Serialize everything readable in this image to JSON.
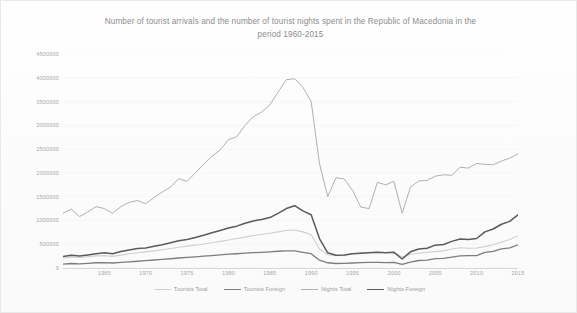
{
  "chart_data": {
    "type": "line",
    "title": "Number of tourist arrivals and the number of tourist nights spent in the Republic of Macedonia in the period 1960-2015",
    "title_line1": "Number of tourist arrivals and the number of tourist nights spent in the Republic of Macedonia in the",
    "title_line2": "period 1960-2015",
    "xlabel": "",
    "ylabel": "",
    "grid": "horizontal-faint",
    "legend_position": "bottom",
    "xlim": [
      1960,
      2015
    ],
    "ylim": [
      0,
      4500000
    ],
    "ytick_labels": [
      "4500000",
      "4000000",
      "3500000",
      "3000000",
      "2500000",
      "2000000",
      "1500000",
      "1000000",
      "500000",
      "0"
    ],
    "ytick_values": [
      4500000,
      4000000,
      3500000,
      3000000,
      2500000,
      2000000,
      1500000,
      1000000,
      500000,
      0
    ],
    "xtick_labels": [
      "1965",
      "1970",
      "1975",
      "1980",
      "1985",
      "1990",
      "1995",
      "2000",
      "2005",
      "2010",
      "2015"
    ],
    "xtick_values": [
      1965,
      1970,
      1975,
      1980,
      1985,
      1990,
      1995,
      2000,
      2005,
      2010,
      2015
    ],
    "x": [
      1960,
      1961,
      1962,
      1963,
      1964,
      1965,
      1966,
      1967,
      1968,
      1969,
      1970,
      1971,
      1972,
      1973,
      1974,
      1975,
      1976,
      1977,
      1978,
      1979,
      1980,
      1981,
      1982,
      1983,
      1984,
      1985,
      1986,
      1987,
      1988,
      1989,
      1990,
      1991,
      1992,
      1993,
      1994,
      1995,
      1996,
      1997,
      1998,
      1999,
      2000,
      2001,
      2002,
      2003,
      2004,
      2005,
      2006,
      2007,
      2008,
      2009,
      2010,
      2011,
      2012,
      2013,
      2014,
      2015
    ],
    "series": [
      {
        "name": "Tourists Total",
        "color": "#cfcfcf",
        "width": 1.1,
        "values": [
          205000,
          230000,
          215000,
          235000,
          255000,
          260000,
          245000,
          270000,
          300000,
          320000,
          340000,
          360000,
          385000,
          410000,
          435000,
          460000,
          480000,
          505000,
          530000,
          560000,
          590000,
          620000,
          650000,
          680000,
          705000,
          730000,
          760000,
          790000,
          800000,
          760000,
          700000,
          400000,
          280000,
          260000,
          265000,
          300000,
          320000,
          330000,
          330000,
          325000,
          330000,
          230000,
          290000,
          310000,
          330000,
          345000,
          360000,
          400000,
          425000,
          415000,
          420000,
          450000,
          490000,
          540000,
          600000,
          680000
        ]
      },
      {
        "name": "Tourists Foreign",
        "color": "#7d7d7d",
        "width": 1.3,
        "values": [
          82000,
          95000,
          88000,
          98000,
          110000,
          112000,
          105000,
          118000,
          130000,
          142000,
          155000,
          168000,
          180000,
          195000,
          210000,
          222000,
          235000,
          250000,
          262000,
          275000,
          290000,
          300000,
          312000,
          322000,
          330000,
          340000,
          352000,
          362000,
          360000,
          330000,
          300000,
          165000,
          110000,
          95000,
          96000,
          105000,
          112000,
          118000,
          118000,
          114000,
          118000,
          74000,
          122000,
          158000,
          165000,
          197000,
          202000,
          230000,
          255000,
          259000,
          262000,
          327000,
          351000,
          400000,
          425000,
          486000
        ]
      },
      {
        "name": "Nights Total",
        "color": "#b0b0b0",
        "width": 1.0,
        "values": [
          1150000,
          1240000,
          1080000,
          1180000,
          1290000,
          1250000,
          1150000,
          1290000,
          1380000,
          1420000,
          1350000,
          1480000,
          1600000,
          1700000,
          1880000,
          1820000,
          2000000,
          2180000,
          2350000,
          2480000,
          2700000,
          2760000,
          3000000,
          3180000,
          3280000,
          3430000,
          3700000,
          3960000,
          3980000,
          3800000,
          3500000,
          2200000,
          1500000,
          1900000,
          1870000,
          1630000,
          1280000,
          1250000,
          1800000,
          1750000,
          1820000,
          1150000,
          1700000,
          1830000,
          1840000,
          1930000,
          1960000,
          1950000,
          2120000,
          2100000,
          2200000,
          2180000,
          2170000,
          2250000,
          2310000,
          2400000
        ]
      },
      {
        "name": "Nights Foreign",
        "color": "#5a5a5a",
        "width": 1.5,
        "values": [
          240000,
          270000,
          250000,
          275000,
          300000,
          320000,
          300000,
          345000,
          380000,
          410000,
          420000,
          455000,
          490000,
          530000,
          575000,
          600000,
          640000,
          690000,
          740000,
          790000,
          840000,
          880000,
          940000,
          990000,
          1020000,
          1060000,
          1150000,
          1250000,
          1310000,
          1200000,
          1120000,
          620000,
          320000,
          270000,
          275000,
          300000,
          310000,
          320000,
          330000,
          320000,
          330000,
          190000,
          340000,
          400000,
          415000,
          480000,
          495000,
          560000,
          610000,
          600000,
          620000,
          760000,
          820000,
          920000,
          980000,
          1120000
        ]
      }
    ]
  },
  "legend": {
    "items": [
      {
        "label": "Tourists Total"
      },
      {
        "label": "Tourists Foreign"
      },
      {
        "label": "Nights Total"
      },
      {
        "label": "Nights Foreign"
      }
    ]
  }
}
